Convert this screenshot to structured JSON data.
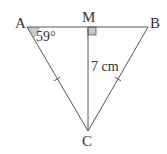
{
  "diagram": {
    "type": "isosceles-triangle",
    "colors": {
      "stroke": "#555555",
      "fill_marker": "#c8c8c8",
      "text": "#333333"
    },
    "vertices": {
      "A": {
        "label": "A",
        "x": 27,
        "y": 27
      },
      "B": {
        "label": "B",
        "x": 148,
        "y": 27
      },
      "C": {
        "label": "C",
        "x": 88,
        "y": 131
      },
      "M": {
        "label": "M",
        "x": 88,
        "y": 27
      }
    },
    "angle_label": "59°",
    "height_label": "7 cm",
    "right_angle_at": "M",
    "equal_sides": [
      "AC",
      "BC"
    ]
  }
}
